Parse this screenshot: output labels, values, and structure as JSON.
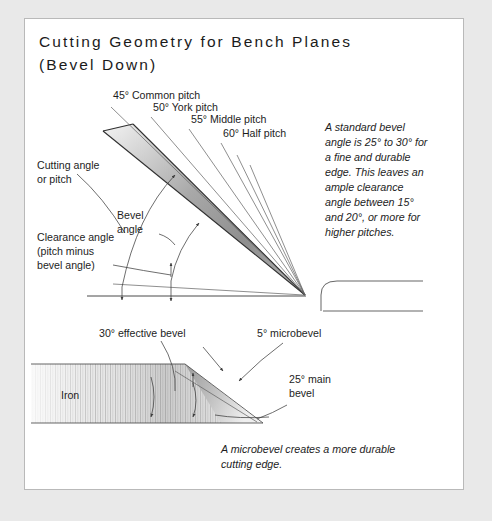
{
  "figure": {
    "title_line1": "Cutting Geometry for Bench Planes",
    "title_line2": "(Bevel Down)",
    "frame_color": "#b9b9b9",
    "page_background": "#e9e9e9",
    "panel_background": "#ffffff",
    "ink_color": "#1d1d1d"
  },
  "upper_diagram": {
    "pitch_labels": [
      {
        "label": "45° Common pitch",
        "angle_deg": 45,
        "name": "common-pitch"
      },
      {
        "label": "50° York pitch",
        "angle_deg": 50,
        "name": "york-pitch"
      },
      {
        "label": "55° Middle pitch",
        "angle_deg": 55,
        "name": "middle-pitch"
      },
      {
        "label": "60° Half pitch",
        "angle_deg": 60,
        "name": "half-pitch"
      }
    ],
    "callouts": [
      {
        "line1": "Cutting angle",
        "line2": "or pitch",
        "name": "cutting-angle"
      },
      {
        "line1": "Bevel",
        "line2": "angle",
        "name": "bevel-angle"
      },
      {
        "line1": "Clearance angle",
        "line2": "(pitch minus",
        "line3": "bevel angle)",
        "name": "clearance-angle"
      }
    ],
    "sole_profile_name": "plane-sole-profile"
  },
  "side_note": {
    "lines": [
      "A standard bevel",
      "angle is 25° to 30° for",
      "a fine and durable",
      "edge. This leaves an",
      "ample clearance",
      "angle between 15°",
      "and 20°, or more for",
      "higher pitches."
    ]
  },
  "lower_diagram": {
    "iron_label": "Iron",
    "callouts": [
      {
        "label": "30° effective bevel",
        "name": "effective-bevel"
      },
      {
        "label": "5° microbevel",
        "name": "microbevel"
      },
      {
        "line1": "25° main",
        "line2": "bevel",
        "name": "main-bevel"
      }
    ],
    "caption": {
      "line1": "A microbevel creates a more durable",
      "line2": "cutting edge."
    }
  }
}
